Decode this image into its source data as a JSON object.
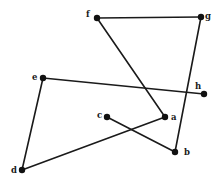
{
  "diagram": {
    "type": "graph",
    "directed": false,
    "node_color": "#111111",
    "edge_color": "#1a1a1a",
    "nodes": [
      {
        "id": "a",
        "label": "a",
        "x": 165,
        "y": 117,
        "lx": 171,
        "ly": 120
      },
      {
        "id": "b",
        "label": "b",
        "x": 175,
        "y": 152,
        "lx": 184,
        "ly": 155
      },
      {
        "id": "c",
        "label": "c",
        "x": 107,
        "y": 117,
        "lx": 97,
        "ly": 118
      },
      {
        "id": "d",
        "label": "d",
        "x": 22,
        "y": 170,
        "lx": 11,
        "ly": 173
      },
      {
        "id": "e",
        "label": "e",
        "x": 43,
        "y": 78,
        "lx": 32,
        "ly": 80
      },
      {
        "id": "f",
        "label": "f",
        "x": 97,
        "y": 18,
        "lx": 86,
        "ly": 17
      },
      {
        "id": "g",
        "label": "g",
        "x": 201,
        "y": 17,
        "lx": 205,
        "ly": 19
      },
      {
        "id": "h",
        "label": "h",
        "x": 204,
        "y": 94,
        "lx": 195,
        "ly": 89
      }
    ],
    "edges": [
      {
        "from": "f",
        "to": "g"
      },
      {
        "from": "f",
        "to": "a"
      },
      {
        "from": "g",
        "to": "b"
      },
      {
        "from": "e",
        "to": "h"
      },
      {
        "from": "e",
        "to": "d"
      },
      {
        "from": "d",
        "to": "a"
      },
      {
        "from": "c",
        "to": "b"
      }
    ]
  }
}
